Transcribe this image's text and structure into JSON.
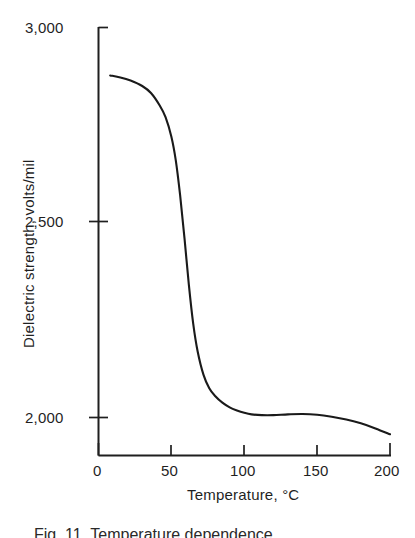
{
  "figure": {
    "caption": "Fig. 11.  Temperature  dependence",
    "background_color": "#ffffff",
    "line_color": "#1a1a1a",
    "axis_color": "#1f1f1f"
  },
  "chart_data": {
    "type": "line",
    "title": "",
    "subtitle": "",
    "xlabel": "Temperature, °C",
    "ylabel": "Dielectric strength, volts/mil",
    "xlim": [
      0,
      200
    ],
    "ylim": [
      1850,
      3000
    ],
    "xticks": [
      0,
      50,
      100,
      150,
      200
    ],
    "xtick_labels": [
      "0",
      "50",
      "100",
      "150",
      "200"
    ],
    "yticks": [
      2000,
      2500,
      3000
    ],
    "ytick_labels": [
      "2,000",
      "2,500",
      "3,000"
    ],
    "grid": false,
    "legend": null,
    "legend_position": "none",
    "annotations": [],
    "series": [
      {
        "name": "Dielectric strength",
        "x": [
          8,
          15,
          22,
          30,
          36,
          42,
          46,
          50,
          53,
          56,
          59,
          62,
          65,
          68,
          72,
          76,
          80,
          85,
          90,
          95,
          100,
          105,
          112,
          120,
          130,
          140,
          150,
          160,
          170,
          180,
          190,
          200
        ],
        "y": [
          2877,
          2872,
          2864,
          2850,
          2832,
          2800,
          2770,
          2720,
          2660,
          2570,
          2460,
          2340,
          2240,
          2170,
          2110,
          2075,
          2055,
          2038,
          2026,
          2018,
          2012,
          2008,
          2006,
          2006,
          2008,
          2009,
          2007,
          2002,
          1995,
          1985,
          1972,
          1957
        ]
      }
    ]
  },
  "axis_labels": {
    "y": [
      "3,000",
      "2,500",
      "2,000"
    ],
    "x": [
      "0",
      "50",
      "100",
      "150",
      "200"
    ]
  }
}
